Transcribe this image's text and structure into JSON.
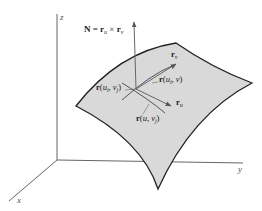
{
  "figure": {
    "type": "3D parametric surface with tangent vectors and normal",
    "axes": {
      "x_label": "x",
      "y_label": "y",
      "z_label": "z"
    },
    "normal_label": {
      "lhs": "N",
      "eq": " = ",
      "r1": "r",
      "r1_sub": "u",
      "cross": " × ",
      "r2": "r",
      "r2_sub": "v"
    },
    "labels": {
      "rv": {
        "r": "r",
        "sub": "v"
      },
      "ru": {
        "r": "r",
        "sub": "u"
      },
      "r_ui_v": {
        "r": "r",
        "open": "(",
        "u": "u",
        "u_sub": "i",
        "comma": ", ",
        "v": "v",
        "close": ")"
      },
      "r_ui_vj": {
        "r": "r",
        "open": "(",
        "u": "u",
        "u_sub": "i",
        "comma": ", ",
        "v": "v",
        "v_sub": "j",
        "close": ")"
      },
      "r_u_vj": {
        "r": "r",
        "open": "(",
        "u": "u",
        "comma": ", ",
        "v": "v",
        "v_sub": "j",
        "close": ")"
      }
    },
    "colors": {
      "surface_fill": "#d9d9d9",
      "surface_edge": "#222222",
      "axis": "#555555",
      "vector": "#666666"
    }
  }
}
